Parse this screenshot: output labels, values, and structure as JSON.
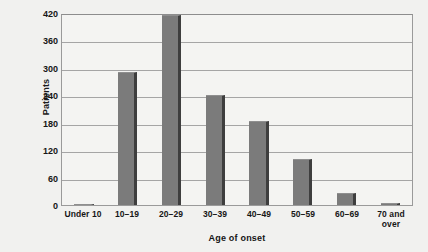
{
  "chart_data": {
    "type": "bar",
    "title": "",
    "subtitle": "",
    "xlabel": "Age of onset",
    "ylabel": "Patients",
    "categories": [
      "Under 10",
      "10–19",
      "20–29",
      "30–39",
      "40–49",
      "50–59",
      "60–69",
      "70 and over"
    ],
    "category_lines": [
      [
        "Under 10"
      ],
      [
        "10–19"
      ],
      [
        "20–29"
      ],
      [
        "30–39"
      ],
      [
        "40–49"
      ],
      [
        "50–59"
      ],
      [
        "60–69"
      ],
      [
        "70 and",
        "over"
      ]
    ],
    "values": [
      2,
      292,
      415,
      240,
      184,
      100,
      26,
      5
    ],
    "ylim": [
      0,
      420
    ],
    "yticks": [
      0,
      60,
      120,
      180,
      240,
      300,
      360,
      420
    ],
    "ytick_labels": [
      "0",
      "60",
      "120",
      "180",
      "240",
      "300",
      "360",
      "420"
    ],
    "grid": true,
    "grid_axis": "y",
    "legend": false,
    "legend_position": "none",
    "bar_color": "#7b7b7b",
    "bar_edge_color": "#3e3e3e",
    "plot_background": "#f4f4f2",
    "figure_background": "#f1f1ef",
    "gridline_color": "#a5a5a5",
    "axis_frame_color": "#9a9a9a",
    "text_color": "#161616"
  }
}
